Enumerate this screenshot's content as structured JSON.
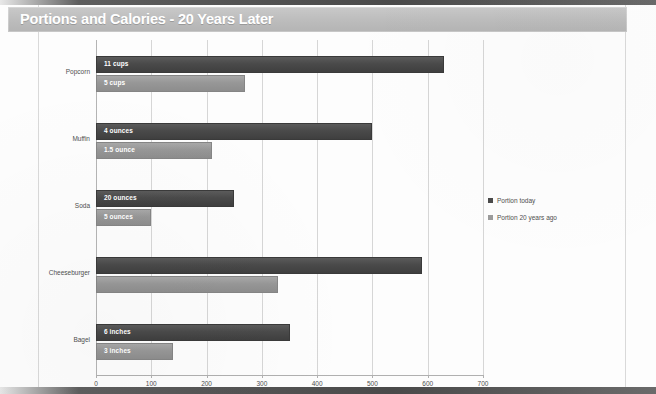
{
  "title": "Portions and Calories - 20 Years Later",
  "legend": {
    "items": [
      {
        "label": "Portion today",
        "color": "#4a4a4a",
        "key": "today"
      },
      {
        "label": "Portion 20 years ago",
        "color": "#9b9b9b",
        "key": "past"
      }
    ]
  },
  "chart_data": {
    "type": "bar",
    "orientation": "horizontal",
    "title": "Portions and Calories - 20 Years Later",
    "xlabel": "",
    "ylabel": "",
    "xlim": [
      0,
      700
    ],
    "xticks": [
      0,
      100,
      200,
      300,
      400,
      500,
      600,
      700
    ],
    "grid": true,
    "legend_position": "right",
    "categories": [
      "Popcorn",
      "Muffin",
      "Soda",
      "Cheeseburger",
      "Bagel"
    ],
    "series": [
      {
        "name": "Portion today",
        "color": "#4a4a4a",
        "values": [
          630,
          500,
          250,
          590,
          350
        ],
        "point_labels": [
          "11 cups",
          "4 ounces",
          "20 ounces",
          "",
          "6 inches"
        ]
      },
      {
        "name": "Portion 20 years ago",
        "color": "#9b9b9b",
        "values": [
          270,
          210,
          100,
          330,
          140
        ],
        "point_labels": [
          "5 cups",
          "1.5 ounce",
          "5 ounces",
          "",
          "3 inches"
        ]
      }
    ]
  }
}
